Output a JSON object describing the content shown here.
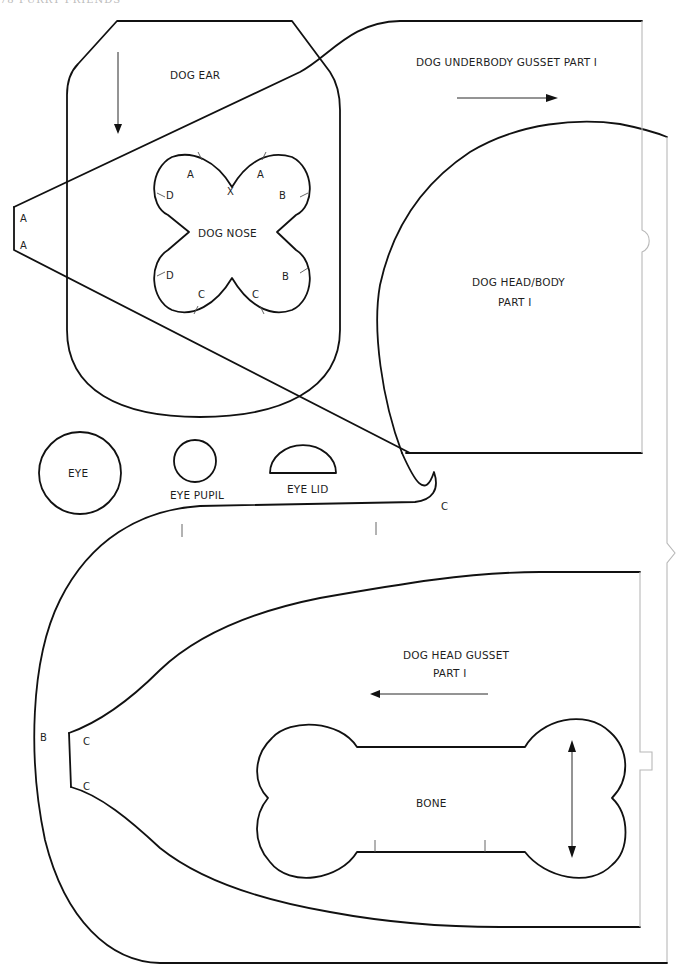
{
  "page": {
    "running_head": "78  FURRY FRIENDS"
  },
  "pieces": {
    "dog_ear": {
      "label": "DOG EAR",
      "grain": "vertical-down"
    },
    "dog_nose": {
      "label": "DOG NOSE",
      "center_mark": "X",
      "notch_marks": [
        "A",
        "A",
        "B",
        "B",
        "C",
        "C",
        "D",
        "D"
      ]
    },
    "underbody_gusset": {
      "label": "DOG UNDERBODY GUSSET PART I",
      "grain": "horizontal-right",
      "end_marks": [
        "A",
        "A"
      ]
    },
    "head_body": {
      "label_line1": "DOG HEAD/BODY",
      "label_line2": "PART I",
      "marks": [
        "C",
        "B"
      ]
    },
    "eye": {
      "label": "EYE"
    },
    "eye_pupil": {
      "label": "EYE PUPIL"
    },
    "eye_lid": {
      "label": "EYE LID"
    },
    "head_gusset": {
      "label_line1": "DOG HEAD GUSSET",
      "label_line2": "PART I",
      "grain": "horizontal-left",
      "end_marks": [
        "C",
        "C"
      ]
    },
    "bone": {
      "label": "BONE",
      "grain": "vertical-double"
    }
  },
  "colors": {
    "cut_line": "#111111",
    "fold_line": "#b8b8b8",
    "background": "#ffffff"
  }
}
